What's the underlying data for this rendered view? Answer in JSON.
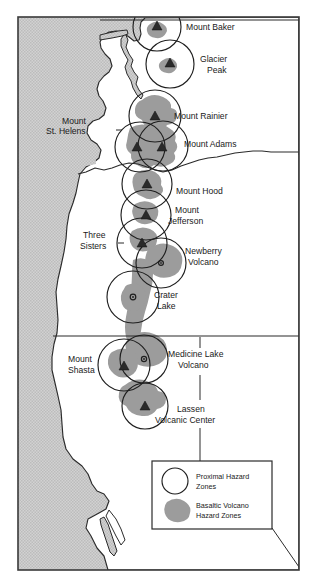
{
  "map": {
    "title": "Cascade Range Volcano Hazard Zones",
    "region": "Pacific Northwest",
    "ocean_color": "#c9c9c9",
    "land_color": "#ffffff",
    "hazard_zone_color": "#9c9c9c",
    "line_color": "#2b2b2b"
  },
  "volcanoes": [
    {
      "id": "mount-baker",
      "label": "Mount Baker",
      "marker": "triangle"
    },
    {
      "id": "glacier-peak",
      "label": "Glacier\nPeak",
      "marker": "triangle"
    },
    {
      "id": "mount-rainier",
      "label": "Mount Rainier",
      "marker": "triangle"
    },
    {
      "id": "mount-st-helens",
      "label": "Mount\nSt. Helens",
      "marker": "triangle"
    },
    {
      "id": "mount-adams",
      "label": "Mount Adams",
      "marker": "triangle"
    },
    {
      "id": "mount-hood",
      "label": "Mount Hood",
      "marker": "triangle"
    },
    {
      "id": "mount-jefferson",
      "label": "Mount\nJefferson",
      "marker": "triangle"
    },
    {
      "id": "three-sisters",
      "label": "Three\nSisters",
      "marker": "triangle"
    },
    {
      "id": "newberry-volcano",
      "label": "Newberry\nVolcano",
      "marker": "caldera"
    },
    {
      "id": "crater-lake",
      "label": "Crater\nLake",
      "marker": "caldera"
    },
    {
      "id": "mount-shasta",
      "label": "Mount\nShasta",
      "marker": "triangle"
    },
    {
      "id": "medicine-lake-volcano",
      "label": "Medicine Lake\nVolcano",
      "marker": "caldera"
    },
    {
      "id": "lassen-volcanic-center",
      "label": "Lassen\nVolcanic Center",
      "marker": "triangle"
    }
  ],
  "labels": {
    "mount_baker": "Mount Baker",
    "glacier_peak_line1": "Glacier",
    "glacier_peak_line2": "Peak",
    "mount_rainier": "Mount Rainier",
    "mount_st_helens_line1": "Mount",
    "mount_st_helens_line2": "St. Helens",
    "mount_adams": "Mount Adams",
    "mount_hood": "Mount Hood",
    "mount_jefferson_line1": "Mount",
    "mount_jefferson_line2": "Jefferson",
    "three_sisters_line1": "Three",
    "three_sisters_line2": "Sisters",
    "newberry_line1": "Newberry",
    "newberry_line2": "Volcano",
    "crater_lake_line1": "Crater",
    "crater_lake_line2": "Lake",
    "mount_shasta_line1": "Mount",
    "mount_shasta_line2": "Shasta",
    "medicine_lake_line1": "Medicine Lake",
    "medicine_lake_line2": "Volcano",
    "lassen_line1": "Lassen",
    "lassen_line2": "Volcanic Center"
  },
  "legend": {
    "items": [
      {
        "id": "proximal-hazard-zones",
        "symbol": "circle",
        "line1": "Proximal Hazard",
        "line2": "Zones"
      },
      {
        "id": "basaltic-volcano-hazard-zones",
        "symbol": "blob",
        "line1": "Basaltic Volcano",
        "line2": "Hazard Zones"
      }
    ]
  }
}
